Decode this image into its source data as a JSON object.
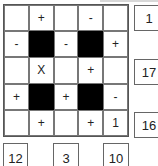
{
  "puzzle": {
    "grid": [
      [
        {
          "v": "",
          "black": false
        },
        {
          "v": "+",
          "black": false
        },
        {
          "v": "",
          "black": false
        },
        {
          "v": "-",
          "black": false
        },
        {
          "v": "",
          "black": false
        }
      ],
      [
        {
          "v": "-",
          "black": false
        },
        {
          "v": "",
          "black": true
        },
        {
          "v": "-",
          "black": false
        },
        {
          "v": "",
          "black": true
        },
        {
          "v": "+",
          "black": false
        }
      ],
      [
        {
          "v": "",
          "black": false
        },
        {
          "v": "X",
          "black": false
        },
        {
          "v": "",
          "black": false
        },
        {
          "v": "+",
          "black": false
        },
        {
          "v": "",
          "black": false
        }
      ],
      [
        {
          "v": "+",
          "black": false
        },
        {
          "v": "",
          "black": true
        },
        {
          "v": "+",
          "black": false
        },
        {
          "v": "",
          "black": true
        },
        {
          "v": "-",
          "black": false
        }
      ],
      [
        {
          "v": "",
          "black": false
        },
        {
          "v": "+",
          "black": false
        },
        {
          "v": "",
          "black": false
        },
        {
          "v": "+",
          "black": false
        },
        {
          "v": "1",
          "black": false
        }
      ]
    ],
    "row_results": [
      "1",
      "17",
      "16"
    ],
    "col_results": [
      "12",
      "3",
      "10"
    ]
  }
}
